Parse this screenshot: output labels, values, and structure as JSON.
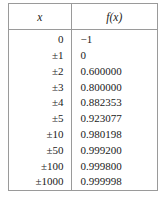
{
  "table": {
    "headers": {
      "x": "x",
      "fx": "f(x)"
    },
    "rows": [
      {
        "x": "0",
        "fx": "−1"
      },
      {
        "x": "±1",
        "fx": "0"
      },
      {
        "x": "±2",
        "fx": "0.600000"
      },
      {
        "x": "±3",
        "fx": "0.800000"
      },
      {
        "x": "±4",
        "fx": "0.882353"
      },
      {
        "x": "±5",
        "fx": "0.923077"
      },
      {
        "x": "±10",
        "fx": "0.980198"
      },
      {
        "x": "±50",
        "fx": "0.999200"
      },
      {
        "x": "±100",
        "fx": "0.999800"
      },
      {
        "x": "±1000",
        "fx": "0.999998"
      }
    ]
  },
  "style": {
    "border_color": "#9a9a9a",
    "text_color": "#1a1a1a",
    "background": "#ffffff"
  }
}
